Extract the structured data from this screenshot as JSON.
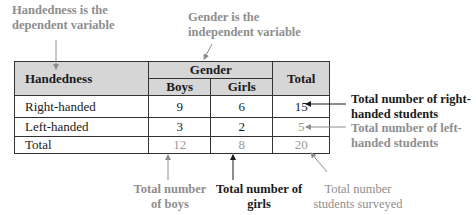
{
  "annotations": {
    "dependent": {
      "line1": "Handedness is the",
      "line2": "dependent variable",
      "color": "#8e8e8e"
    },
    "independent": {
      "line1": "Gender is the",
      "line2": "independent variable",
      "color": "#8e8e8e"
    },
    "right_total": {
      "line1": "Total number of right-",
      "line2": "handed students",
      "color": "#1a1a1a"
    },
    "left_total": {
      "line1": "Total number of left-",
      "line2": "handed students",
      "color": "#8e8e8e"
    },
    "boys_total": {
      "line1": "Total number",
      "line2": "of boys",
      "color": "#8e8e8e"
    },
    "girls_total": {
      "line1": "Total number of",
      "line2": "girls",
      "color": "#1a1a1a"
    },
    "grand_total": {
      "line1": "Total number",
      "line2": "students surveyed",
      "color": "#8e8e8e"
    }
  },
  "table": {
    "row_header": "Handedness",
    "group_header": "Gender",
    "columns": [
      "Boys",
      "Girls"
    ],
    "total_header": "Total",
    "rows": [
      {
        "label": "Right-handed",
        "boys": "9",
        "girls": "6",
        "total": "15"
      },
      {
        "label": "Left-handed",
        "boys": "3",
        "girls": "2",
        "total": "5"
      },
      {
        "label": "Total",
        "boys": "12",
        "girls": "8",
        "total": "20"
      }
    ],
    "header_bg": "#d6d6d6"
  }
}
